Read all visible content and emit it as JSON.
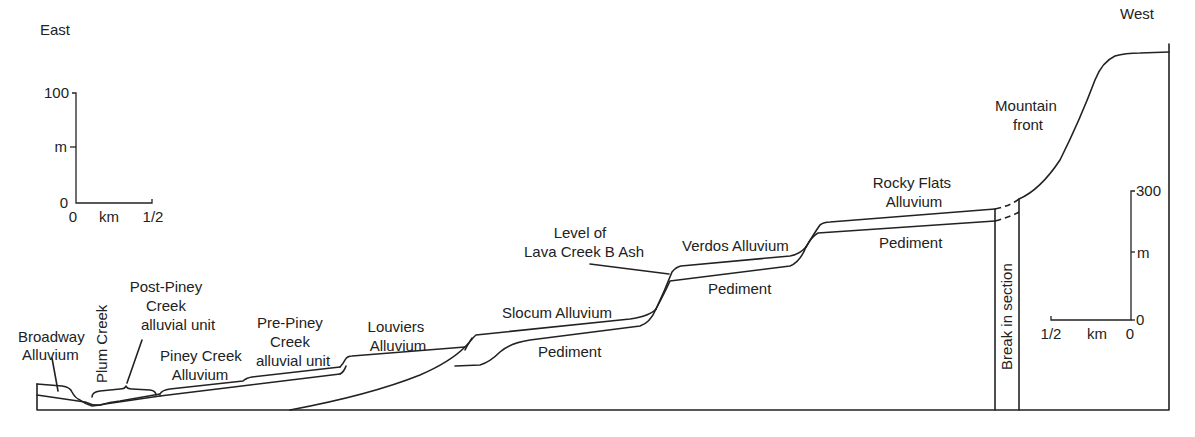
{
  "orientation": {
    "left": "East",
    "right": "West"
  },
  "scale_left": {
    "vertical": {
      "ticks": [
        "100",
        "m",
        "0"
      ],
      "unit": "m",
      "max": 100
    },
    "horizontal": {
      "ticks": [
        "0",
        "km",
        "1/2"
      ],
      "unit": "km",
      "max": 0.5
    }
  },
  "scale_right": {
    "vertical": {
      "ticks": [
        "300",
        "m",
        "0"
      ],
      "unit": "m",
      "max": 300
    },
    "horizontal": {
      "ticks": [
        "1/2",
        "km",
        "0"
      ],
      "unit": "km",
      "max": 0.5
    }
  },
  "labels": {
    "broadway": [
      "Broadway",
      "Alluvium"
    ],
    "plum_creek": "Plum Creek",
    "post_piney": [
      "Post-Piney",
      "Creek",
      "alluvial unit"
    ],
    "piney_creek": [
      "Piney Creek",
      "Alluvium"
    ],
    "pre_piney": [
      "Pre-Piney",
      "Creek",
      "alluvial unit"
    ],
    "louviers": [
      "Louviers",
      "Alluvium"
    ],
    "slocum": "Slocum Alluvium",
    "pediment_1": "Pediment",
    "lava_creek": [
      "Level of",
      "Lava Creek B Ash"
    ],
    "verdos": "Verdos Alluvium",
    "pediment_2": "Pediment",
    "rocky_flats": [
      "Rocky Flats",
      "Alluvium"
    ],
    "pediment_3": "Pediment",
    "break": "Break in section",
    "mountain_front": [
      "Mountain",
      "front"
    ]
  }
}
